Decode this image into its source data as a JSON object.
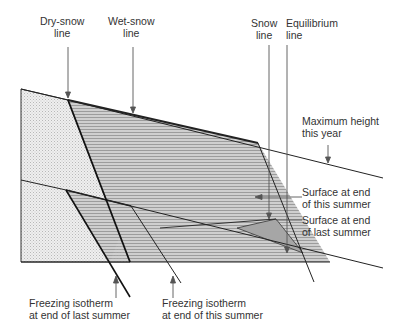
{
  "labels": {
    "dry_snow_line": [
      "Dry-snow",
      "line"
    ],
    "wet_snow_line": [
      "Wet-snow",
      "line"
    ],
    "snow_line": [
      "Snow",
      "line"
    ],
    "equilibrium_line": [
      "Equilibrium",
      "line"
    ],
    "max_height": [
      "Maximum height",
      "this year"
    ],
    "surface_this_summer": [
      "Surface at end",
      "of this summer"
    ],
    "surface_last_summer": [
      "Surface at end",
      "of last summer"
    ],
    "freezing_last_summer": [
      "Freezing isotherm",
      "at end of last summer"
    ],
    "freezing_this_summer": [
      "Freezing isotherm",
      "at end of this summer"
    ]
  },
  "colors": {
    "stipple": "#e2e2e2",
    "hatch": "#c4c4c4",
    "hatch_line": "#9a9a9a",
    "dark_triangle": "#a8a8a8",
    "line": "#222222"
  }
}
